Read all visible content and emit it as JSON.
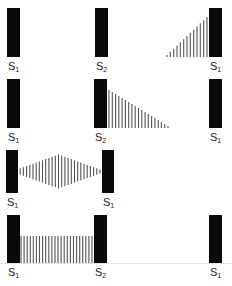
{
  "colors": {
    "bar": "#0a0a0a",
    "wave": "#555555",
    "text": "#222222"
  },
  "rows": [
    {
      "id": "row-1",
      "top": 8,
      "height": 49,
      "bars": [
        {
          "name": "S",
          "sub": "1",
          "x": 7
        },
        {
          "name": "S",
          "sub": "2",
          "x": 95
        },
        {
          "name": "S",
          "sub": "1",
          "x": 209
        }
      ],
      "pattern": {
        "type": "ramp-up",
        "from_x": 167,
        "to_x": 207,
        "min_h": 2,
        "max_h": 40,
        "count": 13
      }
    },
    {
      "id": "row-2",
      "top": 79,
      "height": 49,
      "bars": [
        {
          "name": "S",
          "sub": "1",
          "x": 7
        },
        {
          "name": "S",
          "sub": "2",
          "x": 94
        },
        {
          "name": "S",
          "sub": "1",
          "x": 209
        }
      ],
      "pattern": {
        "type": "ramp-down",
        "from_x": 109,
        "to_x": 168,
        "min_h": 2,
        "max_h": 38,
        "count": 19
      }
    },
    {
      "id": "row-3",
      "top": 150,
      "height": 43,
      "bars": [
        {
          "name": "S",
          "sub": "1",
          "x": 6
        },
        {
          "name": "S",
          "sub": "1",
          "x": 102
        }
      ],
      "pattern": {
        "type": "diamond",
        "from_x": 17,
        "to_x": 100,
        "min_h": 4,
        "max_h": 34,
        "count": 27
      }
    },
    {
      "id": "row-4",
      "top": 215,
      "height": 48,
      "bars": [
        {
          "name": "S",
          "sub": "1",
          "x": 7
        },
        {
          "name": "S",
          "sub": "2",
          "x": 94
        },
        {
          "name": "S",
          "sub": "1",
          "x": 209
        }
      ],
      "pattern": {
        "type": "flat",
        "from_x": 21,
        "to_x": 92,
        "min_h": 27,
        "max_h": 27,
        "count": 24
      }
    }
  ]
}
